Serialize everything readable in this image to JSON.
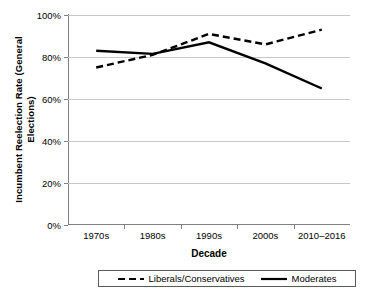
{
  "chart_data": {
    "type": "line",
    "title": "",
    "xlabel": "Decade",
    "ylabel": "Incumbent Reelection Rate (General Elections)",
    "ylabel_line1": "Incumbent Reelection Rate (General",
    "ylabel_line2": "Elections)",
    "categories": [
      "1970s",
      "1980s",
      "1990s",
      "2000s",
      "2010–2016"
    ],
    "ylim": [
      0,
      100
    ],
    "yticks": [
      0,
      20,
      40,
      60,
      80,
      100
    ],
    "ytick_labels": [
      "0%",
      "20%",
      "40%",
      "60%",
      "80%",
      "100%"
    ],
    "grid": true,
    "legend_position": "bottom",
    "series": [
      {
        "name": "Liberals/Conservatives",
        "style": "dashed",
        "color": "#000000",
        "values": [
          75,
          81,
          91,
          86,
          93
        ]
      },
      {
        "name": "Moderates",
        "style": "solid",
        "color": "#000000",
        "values": [
          83,
          81.5,
          87,
          77,
          65
        ]
      }
    ]
  },
  "legend": {
    "items": [
      {
        "label": "Liberals/Conservatives",
        "style": "dashed"
      },
      {
        "label": "Moderates",
        "style": "solid"
      }
    ]
  },
  "colors": {
    "gridline": "#c8c8c8",
    "axis": "#808080",
    "series": "#000000",
    "background": "#ffffff"
  }
}
